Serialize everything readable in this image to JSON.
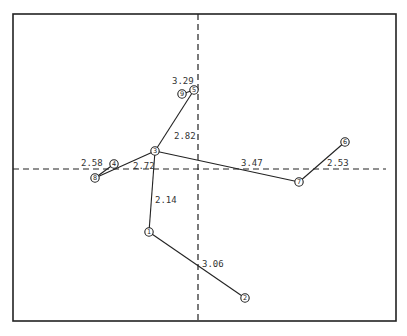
{
  "diagram": {
    "type": "minimum-spanning-tree-ordination",
    "frame": {
      "x1": 13,
      "y1": 14,
      "x2": 396,
      "y2": 321
    },
    "axes": {
      "horizontal": {
        "y": 169,
        "x1": 13,
        "x2": 386,
        "style": "dashed"
      },
      "vertical": {
        "x": 198,
        "y1": 14,
        "y2": 321,
        "style": "dashed"
      }
    },
    "nodes": [
      {
        "id": "1",
        "label": "1",
        "x": 149,
        "y": 232
      },
      {
        "id": "2",
        "label": "2",
        "x": 245,
        "y": 298
      },
      {
        "id": "3",
        "label": "3",
        "x": 155,
        "y": 151
      },
      {
        "id": "4",
        "label": "4",
        "x": 114,
        "y": 164
      },
      {
        "id": "5",
        "label": "5",
        "x": 194,
        "y": 90
      },
      {
        "id": "6",
        "label": "6",
        "x": 345,
        "y": 142
      },
      {
        "id": "7",
        "label": "7",
        "x": 299,
        "y": 182
      },
      {
        "id": "8",
        "label": "8",
        "x": 95,
        "y": 178
      },
      {
        "id": "9",
        "label": "9",
        "x": 182,
        "y": 94
      }
    ],
    "edges": [
      {
        "from": "9",
        "to": "5",
        "label": "3.29",
        "lx": 172,
        "ly": 76
      },
      {
        "from": "5",
        "to": "3",
        "label": "2.82",
        "lx": 174,
        "ly": 131
      },
      {
        "from": "8",
        "to": "4",
        "label": "2.58",
        "lx": 81,
        "ly": 158
      },
      {
        "from": "8",
        "to": "3",
        "label": "2.72",
        "lx": 133,
        "ly": 161
      },
      {
        "from": "3",
        "to": "7",
        "label": "3.47",
        "lx": 241,
        "ly": 158
      },
      {
        "from": "7",
        "to": "6",
        "label": "2.53",
        "lx": 327,
        "ly": 158
      },
      {
        "from": "3",
        "to": "1",
        "label": "2.14",
        "lx": 155,
        "ly": 195
      },
      {
        "from": "1",
        "to": "2",
        "label": "3.06",
        "lx": 202,
        "ly": 259
      }
    ]
  }
}
